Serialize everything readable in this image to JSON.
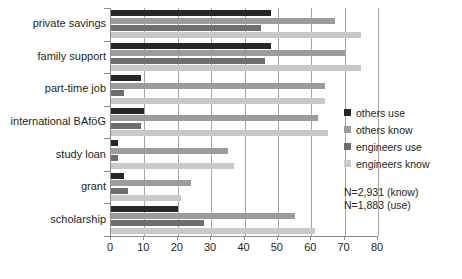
{
  "chart_data": {
    "type": "bar",
    "orientation": "horizontal",
    "title": "",
    "xlabel": "",
    "ylabel": "",
    "xlim": [
      0,
      80
    ],
    "xticks": [
      0,
      10,
      20,
      30,
      40,
      50,
      60,
      70,
      80
    ],
    "grid": true,
    "legend_position": "right",
    "categories": [
      "private savings",
      "family support",
      "part-time job",
      "international BAföG",
      "study loan",
      "grant",
      "scholarship"
    ],
    "series": [
      {
        "name": "others use",
        "color": "#262626",
        "values": [
          48,
          48,
          9,
          10,
          2,
          4,
          20
        ]
      },
      {
        "name": "others know",
        "color": "#9c9c9c",
        "values": [
          67,
          70,
          64,
          62,
          35,
          24,
          55
        ]
      },
      {
        "name": "engineers use",
        "color": "#6e6e6e",
        "values": [
          45,
          46,
          4,
          9,
          2,
          5,
          28
        ]
      },
      {
        "name": "engineers know",
        "color": "#c9c9c9",
        "values": [
          75,
          75,
          64,
          65,
          37,
          21,
          61
        ]
      }
    ],
    "annotations": [
      "N=2,931 (know)",
      "N=1,883 (use)"
    ]
  }
}
